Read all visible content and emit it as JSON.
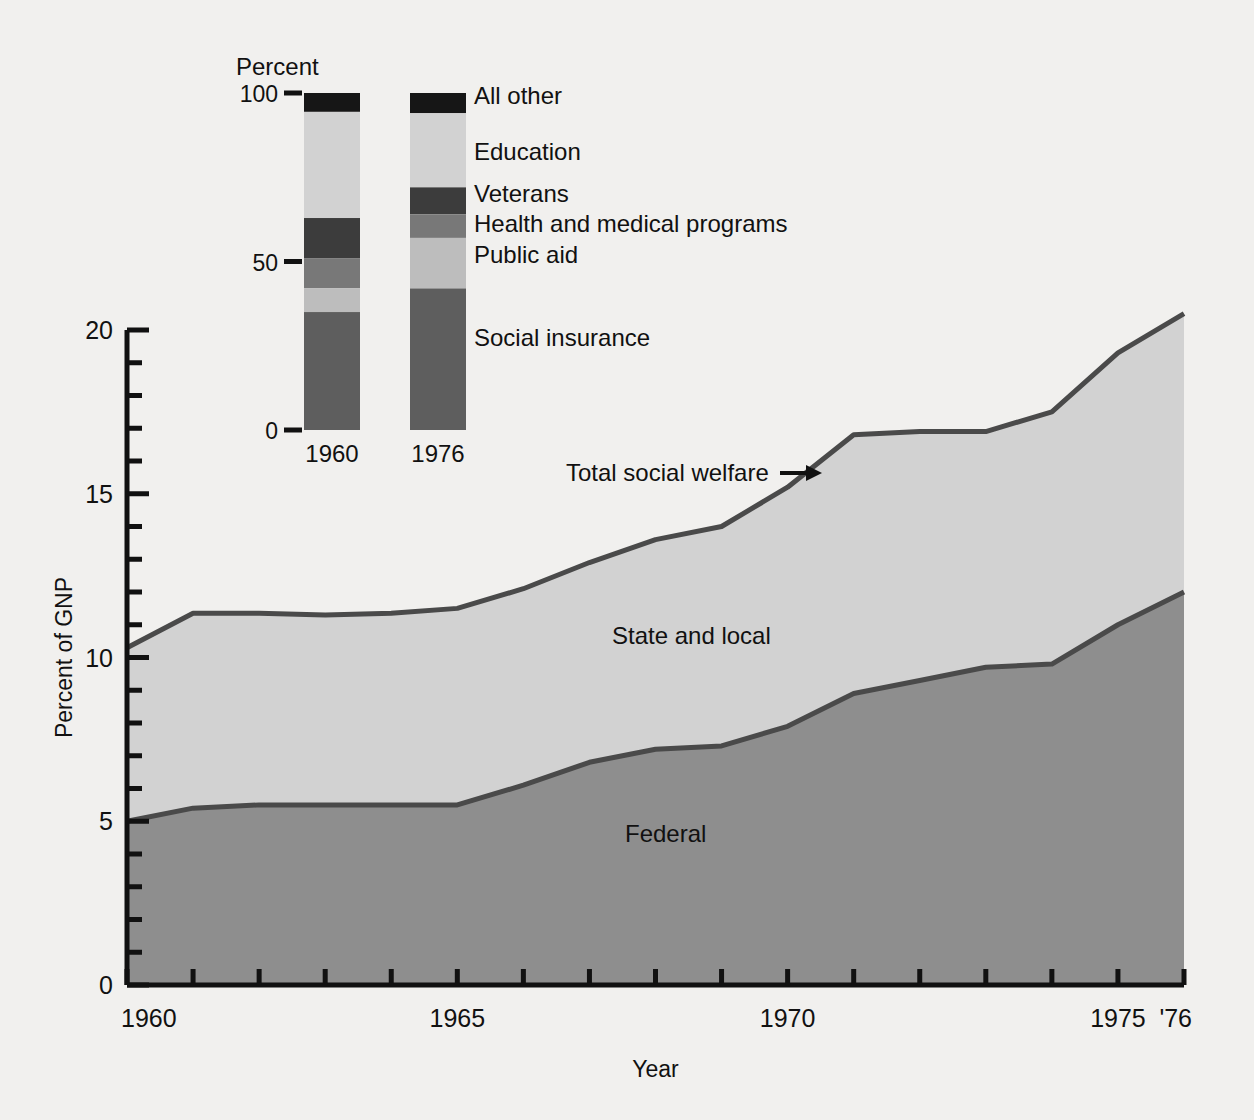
{
  "figure": {
    "background_color": "#f1f0ee",
    "axis_color": "#111111"
  },
  "chart_data": {
    "type": "area",
    "title": "",
    "xlabel": "Year",
    "ylabel": "Percent of GNP",
    "xlim": [
      1960,
      1976
    ],
    "ylim": [
      0,
      20
    ],
    "grid": false,
    "legend": "inline-area-labels",
    "x": [
      1960,
      1961,
      1962,
      1963,
      1964,
      1965,
      1966,
      1967,
      1968,
      1969,
      1970,
      1971,
      1972,
      1973,
      1974,
      1975,
      1976
    ],
    "x_tick_labels": [
      "1960",
      "",
      "",
      "",
      "",
      "1965",
      "",
      "",
      "",
      "",
      "1970",
      "",
      "",
      "",
      "",
      "1975",
      "'76"
    ],
    "y_tick_labels": [
      "0",
      "5",
      "10",
      "15",
      "20"
    ],
    "y_major_ticks": [
      0,
      5,
      10,
      15,
      20
    ],
    "y_minor_ticks": [
      1,
      2,
      3,
      4,
      6,
      7,
      8,
      9,
      11,
      12,
      13,
      14,
      16,
      17,
      18,
      19
    ],
    "series": [
      {
        "name": "Federal",
        "color": "#8e8e8e",
        "line_color": "#4a4a4a",
        "values": [
          5.0,
          5.4,
          5.5,
          5.5,
          5.5,
          5.5,
          6.1,
          6.8,
          7.2,
          7.3,
          7.9,
          8.9,
          9.3,
          9.7,
          9.8,
          11.0,
          12.0
        ]
      },
      {
        "name": "State and local",
        "color": "#d2d2d2",
        "line_color": "#4a4a4a",
        "stacked_top_values": [
          10.3,
          11.35,
          11.35,
          11.3,
          11.35,
          11.5,
          12.1,
          12.9,
          13.6,
          14.0,
          15.2,
          16.8,
          16.9,
          16.9,
          17.5,
          19.3,
          20.5
        ]
      }
    ],
    "annotations": [
      {
        "text": "Total social welfare",
        "arrow": "→",
        "x": 1970,
        "y": 15.9
      },
      {
        "text": "State and local",
        "x": 1968,
        "y": 10.1
      },
      {
        "text": "Federal",
        "x": 1968,
        "y": 4.5
      }
    ]
  },
  "inset": {
    "title": "Percent",
    "y_tick_labels": [
      "100",
      "50",
      "0"
    ],
    "bars": [
      {
        "label": "1960",
        "segments": [
          {
            "name": "All other",
            "value": 5.6,
            "color": "#161616"
          },
          {
            "name": "Education",
            "value": 31.5,
            "color": "#d2d2d2"
          },
          {
            "name": "Veterans",
            "value": 11.9,
            "color": "#3c3c3c"
          },
          {
            "name": "Health and medical programs",
            "value": 8.9,
            "color": "#787878"
          },
          {
            "name": "Public aid",
            "value": 7.1,
            "color": "#bdbdbd"
          },
          {
            "name": "Social insurance",
            "value": 35.0,
            "color": "#5e5e5e"
          }
        ]
      },
      {
        "label": "1976",
        "segments": [
          {
            "name": "All other",
            "value": 6.0,
            "color": "#161616"
          },
          {
            "name": "Education",
            "value": 22.0,
            "color": "#d2d2d2"
          },
          {
            "name": "Veterans",
            "value": 8.0,
            "color": "#3c3c3c"
          },
          {
            "name": "Health and medical programs",
            "value": 7.0,
            "color": "#787878"
          },
          {
            "name": "Public aid",
            "value": 15.0,
            "color": "#bdbdbd"
          },
          {
            "name": "Social insurance",
            "value": 42.0,
            "color": "#5e5e5e"
          }
        ]
      }
    ],
    "category_labels": [
      "All other",
      "Education",
      "Veterans",
      "Health and medical programs",
      "Public aid",
      "Social insurance"
    ]
  }
}
